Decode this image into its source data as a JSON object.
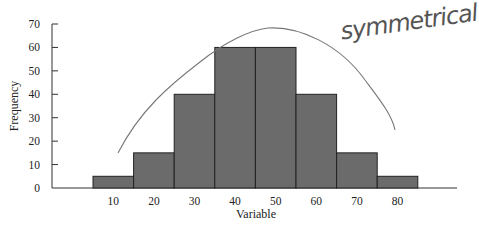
{
  "chart_data": {
    "type": "bar",
    "subtype": "histogram",
    "title": "",
    "xlabel": "Variable",
    "ylabel": "Frequency",
    "categories": [
      "10",
      "20",
      "30",
      "40",
      "50",
      "60",
      "70",
      "80"
    ],
    "values": [
      5,
      15,
      40,
      60,
      60,
      40,
      15,
      5
    ],
    "yticks": [
      0,
      10,
      20,
      30,
      40,
      50,
      60,
      70
    ],
    "ylim": [
      0,
      70
    ],
    "grid": false,
    "legend": null,
    "bar_color": "#6b6b6b",
    "annotations": [
      {
        "text": "symmetrical",
        "type": "handwritten",
        "position": "top-right"
      },
      {
        "type": "handwritten-curve",
        "shape": "bell",
        "description": "hand-drawn bell curve over histogram"
      }
    ]
  },
  "labels": {
    "xlabel": "Variable",
    "ylabel": "Frequency",
    "annotation": "symmetrical"
  }
}
